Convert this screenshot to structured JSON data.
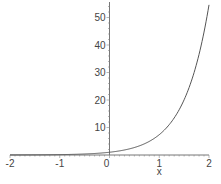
{
  "chart_data": {
    "type": "line",
    "title": "",
    "function": "exp(2x)",
    "xlabel": "x",
    "ylabel": "",
    "xlim": [
      -2,
      2
    ],
    "ylim": [
      0,
      55
    ],
    "grid": false,
    "legend": null,
    "x_ticks": [
      -2,
      -1,
      0,
      1,
      2
    ],
    "y_ticks": [
      10,
      20,
      30,
      40,
      50
    ],
    "x_tick_labels": [
      "-2",
      "-1",
      "0",
      "1",
      "2"
    ],
    "y_tick_labels": [
      "10",
      "20",
      "30",
      "40",
      "50"
    ],
    "series": [
      {
        "name": "y = e^(2x)",
        "color": "#555555",
        "x": [
          -2,
          -1.5,
          -1,
          -0.5,
          0,
          0.25,
          0.5,
          0.75,
          1,
          1.25,
          1.5,
          1.75,
          2
        ],
        "y": [
          0.018,
          0.05,
          0.135,
          0.368,
          1.0,
          1.65,
          2.72,
          4.48,
          7.39,
          12.18,
          20.09,
          33.12,
          54.6
        ]
      }
    ]
  }
}
